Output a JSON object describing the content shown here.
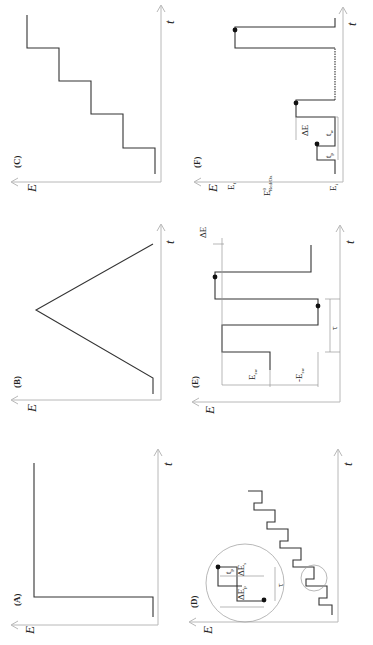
{
  "figure": {
    "orientation": "rotated 90 degrees counter-clockwise",
    "axis_labels": {
      "y": "E",
      "x": "t"
    },
    "panels": [
      {
        "id": "A",
        "label": "(A)",
        "waveform": "potential step"
      },
      {
        "id": "B",
        "label": "(B)",
        "waveform": "linear sweep / cyclic (triangular)"
      },
      {
        "id": "C",
        "label": "(C)",
        "waveform": "staircase"
      },
      {
        "id": "D",
        "label": "(D)",
        "waveform": "differential pulse on staircase",
        "inset_labels": {
          "dE_p": "ΔE",
          "dE_p_sub": "p",
          "dE_s": "ΔE",
          "dE_s_sub": "s",
          "t_p": "t",
          "t_p_sub": "p",
          "tau": "τ"
        }
      },
      {
        "id": "E",
        "label": "(E)",
        "waveform": "square wave",
        "labels": {
          "E_sw": "E",
          "E_sw_sub": "sw",
          "neg_E_sw": "-E",
          "neg_E_sw_sub": "sw",
          "tau": "τ",
          "dE": "ΔE"
        }
      },
      {
        "id": "F",
        "label": "(F)",
        "waveform": "normal pulse",
        "labels": {
          "E_f": "E",
          "E_f_sub": "f",
          "E0": "E",
          "E0_sup": "0",
          "E0_sub": "Red/Ox",
          "E_i": "E",
          "E_i_sub": "i",
          "dE": "ΔE",
          "t_p": "t",
          "t_p_sub": "p",
          "t_w": "t",
          "t_w_sub": "w"
        }
      }
    ]
  }
}
